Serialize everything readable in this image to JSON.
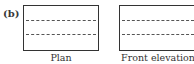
{
  "figure": {
    "part_label": "(b)",
    "views": [
      {
        "name": "plan",
        "caption": "Plan",
        "hidden_lines": 2
      },
      {
        "name": "front-elevation",
        "caption": "Front elevation",
        "hidden_lines": 2
      }
    ]
  }
}
